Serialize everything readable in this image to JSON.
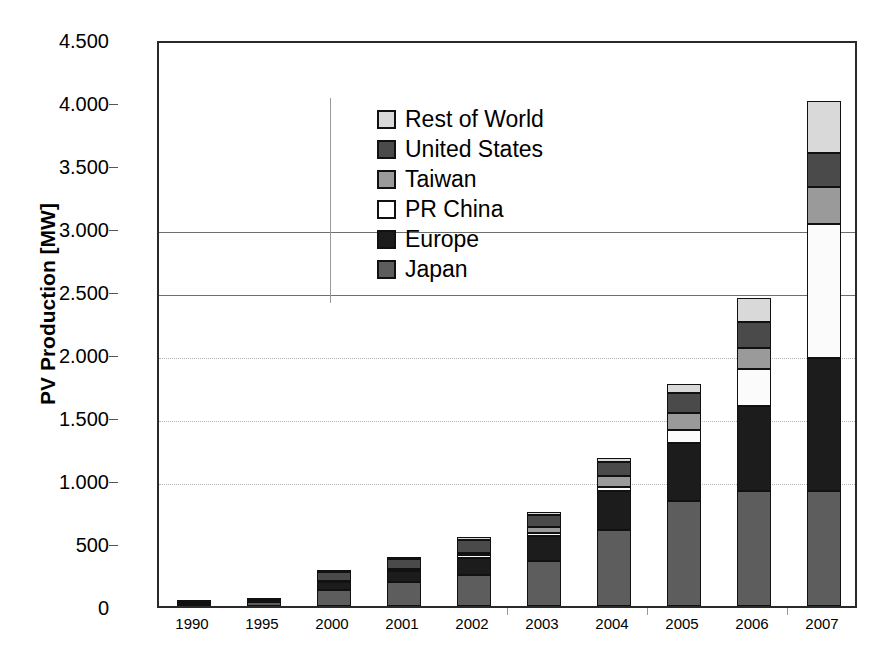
{
  "chart_data": {
    "type": "bar",
    "subtype": "stacked-vertical",
    "title": "",
    "xlabel": "",
    "ylabel": "PV Production [MW]",
    "ylim": [
      0,
      4500
    ],
    "ytick_values": [
      0,
      500,
      1000,
      1500,
      2000,
      2500,
      3000,
      3500,
      4000,
      4500
    ],
    "ytick_labels": [
      "0",
      "500",
      "1.000",
      "1.500",
      "2.000",
      "2.500",
      "3.000",
      "3.500",
      "4.000",
      "4.500"
    ],
    "grid": "horizontal",
    "legend_position": "upper-left-inside",
    "categories": [
      "1990",
      "1995",
      "2000",
      "2001",
      "2002",
      "2003",
      "2004",
      "2005",
      "2006",
      "2007"
    ],
    "series": [
      {
        "name": "Japan",
        "color": "#5d5d5d",
        "values": [
          15,
          30,
          130,
          190,
          250,
          360,
          600,
          830,
          910,
          910
        ]
      },
      {
        "name": "Europe",
        "color": "#1c1c1c",
        "values": [
          15,
          20,
          60,
          90,
          135,
          195,
          310,
          460,
          680,
          1055
        ]
      },
      {
        "name": "PR China",
        "color": "#fbfbfb",
        "values": [
          0,
          0,
          5,
          10,
          20,
          25,
          35,
          110,
          290,
          1070
        ]
      },
      {
        "name": "Taiwan",
        "color": "#9a9a9a",
        "values": [
          0,
          0,
          0,
          0,
          15,
          45,
          90,
          135,
          165,
          290
        ]
      },
      {
        "name": "United States",
        "color": "#4a4a4a",
        "values": [
          5,
          15,
          75,
          85,
          105,
          100,
          110,
          155,
          210,
          270
        ]
      },
      {
        "name": "Rest of World",
        "color": "#d9d9d9",
        "values": [
          0,
          0,
          10,
          10,
          25,
          20,
          30,
          70,
          190,
          410
        ]
      }
    ],
    "totals": [
      35,
      65,
      280,
      385,
      550,
      745,
      1175,
      1760,
      2445,
      4005
    ]
  },
  "axis": {
    "y_title": "PV Production [MW]"
  },
  "legend": {
    "items": [
      {
        "label": "Rest of World",
        "color": "#d9d9d9"
      },
      {
        "label": "United States",
        "color": "#4a4a4a"
      },
      {
        "label": "Taiwan",
        "color": "#9a9a9a"
      },
      {
        "label": "PR China",
        "color": "#ffffff"
      },
      {
        "label": "Europe",
        "color": "#1c1c1c"
      },
      {
        "label": "Japan",
        "color": "#5d5d5d"
      }
    ]
  }
}
